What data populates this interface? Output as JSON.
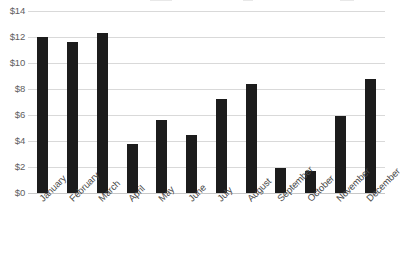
{
  "chart_data": {
    "type": "bar",
    "title": "",
    "subtitle": "",
    "xlabel": "",
    "ylabel": "",
    "categories": [
      "January",
      "February",
      "March",
      "April",
      "May",
      "June",
      "July",
      "August",
      "September",
      "October",
      "November",
      "December"
    ],
    "values": [
      12.0,
      11.6,
      12.3,
      3.8,
      5.6,
      4.5,
      7.2,
      8.4,
      1.9,
      1.7,
      5.9,
      8.8
    ],
    "series": [
      {
        "name": "",
        "values": [
          12.0,
          11.6,
          12.3,
          3.8,
          5.6,
          4.5,
          7.2,
          8.4,
          1.9,
          1.7,
          5.9,
          8.8
        ]
      }
    ],
    "ylim": [
      0,
      14
    ],
    "ytick_values": [
      14,
      12,
      10,
      8,
      6,
      4,
      2,
      0
    ],
    "ytick_labels": [
      "$14",
      "$12",
      "$10",
      "$8",
      "$6",
      "$4",
      "$2",
      "$0"
    ],
    "grid": true,
    "grid_axis": "y",
    "legend": false,
    "legend_position": "none",
    "bar_color": "#1c1c1c",
    "gridline_color": "#d9d9d9",
    "background_color": "#ffffff",
    "tick_label_color": "#5f5f5f",
    "xtick_rotation": -45,
    "annotations": []
  }
}
